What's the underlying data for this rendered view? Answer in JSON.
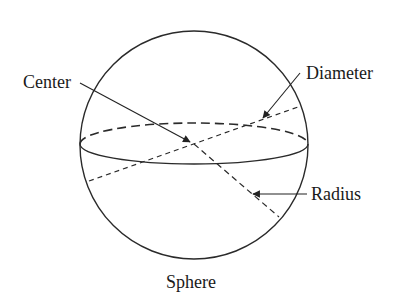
{
  "diagram": {
    "title": "Sphere",
    "labels": {
      "center": "Center",
      "diameter": "Diameter",
      "radius": "Radius"
    },
    "stroke_color": "#2a2a2a"
  }
}
